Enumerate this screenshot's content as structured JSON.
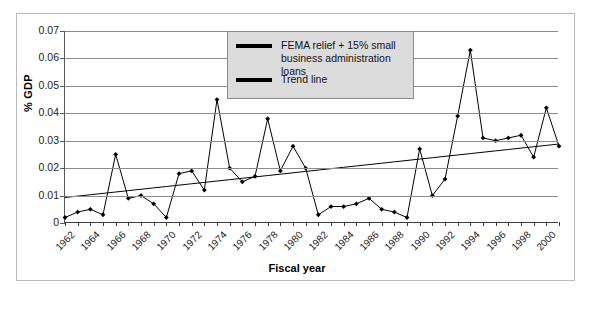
{
  "chart_data": {
    "type": "line",
    "title": "",
    "xlabel": "Fiscal year",
    "ylabel": "% GDP",
    "xlim": [
      1962,
      2001
    ],
    "ylim": [
      0,
      0.07
    ],
    "grid": true,
    "legend_position": "top-center",
    "y_ticks": [
      "0",
      "0.01",
      "0.02",
      "0.03",
      "0.04",
      "0.05",
      "0.06",
      "0.07"
    ],
    "y_tick_values": [
      0,
      0.01,
      0.02,
      0.03,
      0.04,
      0.05,
      0.06,
      0.07
    ],
    "x_tick_labels": [
      "1962",
      "1964",
      "1966",
      "1968",
      "1970",
      "1972",
      "1974",
      "1976",
      "1978",
      "1980",
      "1982",
      "1984",
      "1986",
      "1988",
      "1990",
      "1992",
      "1994",
      "1996",
      "1998",
      "2000"
    ],
    "x": [
      1962,
      1963,
      1964,
      1965,
      1966,
      1967,
      1968,
      1969,
      1970,
      1971,
      1972,
      1973,
      1974,
      1975,
      1976,
      1977,
      1978,
      1979,
      1980,
      1981,
      1982,
      1983,
      1984,
      1985,
      1986,
      1987,
      1988,
      1989,
      1990,
      1991,
      1992,
      1993,
      1994,
      1995,
      1996,
      1997,
      1998,
      1999,
      2000,
      2001
    ],
    "series": [
      {
        "name": "FEMA relief + 15% small business administration loans",
        "color": "#000000",
        "marker": "diamond",
        "values": [
          0.002,
          0.004,
          0.005,
          0.003,
          0.025,
          0.009,
          0.01,
          0.007,
          0.002,
          0.018,
          0.019,
          0.012,
          0.045,
          0.02,
          0.015,
          0.017,
          0.038,
          0.019,
          0.028,
          0.02,
          0.003,
          0.006,
          0.006,
          0.007,
          0.009,
          0.005,
          0.004,
          0.002,
          0.027,
          0.01,
          0.016,
          0.039,
          0.063,
          0.031,
          0.03,
          0.031,
          0.032,
          0.024,
          0.042,
          0.028
        ]
      },
      {
        "name": "Trend line",
        "color": "#000000",
        "marker": "none",
        "values": [
          0.0093,
          0.0098,
          0.0103,
          0.0108,
          0.0113,
          0.0118,
          0.0123,
          0.0128,
          0.0133,
          0.0138,
          0.0143,
          0.0148,
          0.0153,
          0.0158,
          0.0163,
          0.0168,
          0.0173,
          0.0178,
          0.0183,
          0.0188,
          0.0193,
          0.0198,
          0.0203,
          0.0208,
          0.0213,
          0.0218,
          0.0223,
          0.0228,
          0.0233,
          0.0238,
          0.0243,
          0.0248,
          0.0253,
          0.0258,
          0.0263,
          0.0268,
          0.0273,
          0.0278,
          0.0283,
          0.0288
        ]
      }
    ]
  },
  "legend": {
    "entries": [
      {
        "label": "FEMA relief + 15% small business administration loans"
      },
      {
        "label": "Trend line"
      }
    ]
  },
  "axes": {
    "y_title": "% GDP",
    "x_title": "Fiscal year"
  }
}
